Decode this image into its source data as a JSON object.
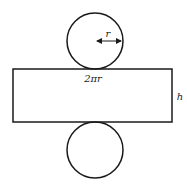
{
  "diagram": {
    "labels": {
      "radius": "r",
      "circumference": "2πr",
      "height": "h"
    },
    "colors": {
      "stroke": "#1a1a1a",
      "background": "#ffffff"
    },
    "shapes": {
      "top_circle": {
        "cx": 95,
        "cy": 41,
        "r": 28
      },
      "rectangle": {
        "x": 13,
        "y": 69,
        "width": 159,
        "height": 53
      },
      "bottom_circle": {
        "cx": 95,
        "cy": 150,
        "r": 28
      }
    }
  }
}
